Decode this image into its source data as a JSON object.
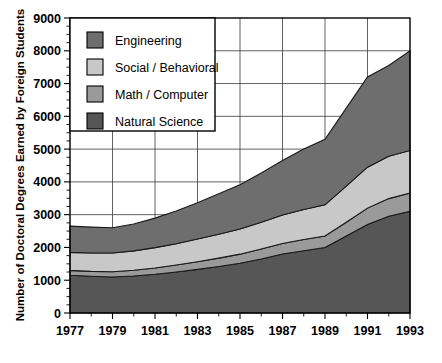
{
  "chart_data": {
    "type": "area",
    "stacked": true,
    "title": "",
    "xlabel": "",
    "ylabel": "Number of Doctoral Degrees Earned by Foreign Students",
    "x": [
      1977,
      1978,
      1979,
      1980,
      1981,
      1982,
      1983,
      1984,
      1985,
      1986,
      1987,
      1988,
      1989,
      1990,
      1991,
      1992,
      1993
    ],
    "xlim": [
      1977,
      1993
    ],
    "ylim": [
      0,
      9000
    ],
    "ytick_values": [
      0,
      1000,
      2000,
      3000,
      4000,
      5000,
      6000,
      7000,
      8000,
      9000
    ],
    "ytick_labels": [
      "0",
      "1000",
      "2000",
      "3000",
      "4000",
      "5000",
      "6000",
      "7000",
      "8000",
      "9000"
    ],
    "ytick_step": 1000,
    "yminor_step": 250,
    "xtick_values": [
      1977,
      1979,
      1981,
      1983,
      1985,
      1987,
      1989,
      1991,
      1993
    ],
    "xtick_labels": [
      "1977",
      "1979",
      "1981",
      "1983",
      "1985",
      "1987",
      "1989",
      "1991",
      "1993"
    ],
    "xminor_values": [
      1978,
      1980,
      1982,
      1984,
      1986,
      1988,
      1990,
      1992
    ],
    "grid": "both",
    "grid_x_step": 2,
    "grid_y_step": 1000,
    "legend_position": "top-left-inset",
    "stack_order_bottom_to_top": [
      "Natural Science",
      "Math / Computer",
      "Social / Behavioral",
      "Engineering"
    ],
    "series": [
      {
        "name": "Natural Science",
        "color": "#565656",
        "values": [
          1150,
          1120,
          1100,
          1130,
          1180,
          1250,
          1330,
          1420,
          1520,
          1650,
          1800,
          1900,
          2000,
          2350,
          2700,
          2950,
          3100
        ]
      },
      {
        "name": "Math / Computer",
        "color": "#9a9a9a",
        "values": [
          150,
          150,
          160,
          175,
          195,
          215,
          235,
          255,
          275,
          300,
          320,
          340,
          350,
          420,
          500,
          540,
          560
        ]
      },
      {
        "name": "Social / Behavioral",
        "color": "#c8c8c8",
        "values": [
          550,
          560,
          570,
          590,
          620,
          650,
          690,
          730,
          770,
          820,
          870,
          920,
          950,
          1100,
          1250,
          1290,
          1300
        ]
      },
      {
        "name": "Engineering",
        "color": "#6e6e6e",
        "values": [
          800,
          790,
          770,
          820,
          900,
          1000,
          1110,
          1230,
          1350,
          1500,
          1660,
          1840,
          2000,
          2380,
          2750,
          2770,
          3040
        ]
      }
    ],
    "totals": [
      2650,
      2620,
      2600,
      2715,
      2895,
      3115,
      3365,
      3635,
      3915,
      4270,
      4650,
      5000,
      5300,
      6250,
      7200,
      7550,
      8000
    ],
    "legend_entries": [
      {
        "label": "Engineering",
        "color": "#6e6e6e"
      },
      {
        "label": "Social / Behavioral",
        "color": "#c8c8c8"
      },
      {
        "label": "Math / Computer",
        "color": "#9a9a9a"
      },
      {
        "label": "Natural Science",
        "color": "#565656"
      }
    ]
  }
}
